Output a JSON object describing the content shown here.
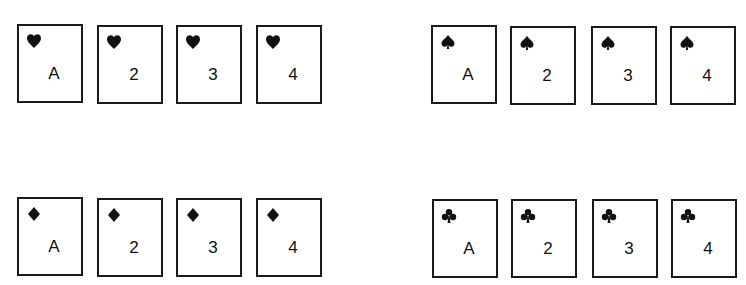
{
  "groups": [
    {
      "suit": "hearts",
      "icon": "heart-icon",
      "cards": [
        {
          "rank": "A",
          "x": 17,
          "y": 24
        },
        {
          "rank": "2",
          "x": 97,
          "y": 25
        },
        {
          "rank": "3",
          "x": 176,
          "y": 25
        },
        {
          "rank": "4",
          "x": 256,
          "y": 25
        }
      ]
    },
    {
      "suit": "spades",
      "icon": "spade-icon",
      "cards": [
        {
          "rank": "A",
          "x": 431,
          "y": 25
        },
        {
          "rank": "2",
          "x": 510,
          "y": 26
        },
        {
          "rank": "3",
          "x": 591,
          "y": 26
        },
        {
          "rank": "4",
          "x": 670,
          "y": 26
        }
      ]
    },
    {
      "suit": "diamonds",
      "icon": "diamond-icon",
      "cards": [
        {
          "rank": "A",
          "x": 17,
          "y": 197
        },
        {
          "rank": "2",
          "x": 97,
          "y": 198
        },
        {
          "rank": "3",
          "x": 176,
          "y": 198
        },
        {
          "rank": "4",
          "x": 256,
          "y": 198
        }
      ]
    },
    {
      "suit": "clubs",
      "icon": "club-icon",
      "cards": [
        {
          "rank": "A",
          "x": 432,
          "y": 199
        },
        {
          "rank": "2",
          "x": 511,
          "y": 199
        },
        {
          "rank": "3",
          "x": 592,
          "y": 199
        },
        {
          "rank": "4",
          "x": 671,
          "y": 199
        }
      ]
    }
  ]
}
